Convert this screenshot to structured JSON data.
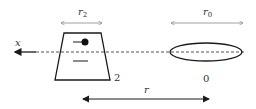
{
  "diagram": {
    "axis_label": "x",
    "body2": {
      "width_label_main": "r",
      "width_label_sub": "2",
      "id_label": "2"
    },
    "body0": {
      "width_label_main": "r",
      "width_label_sub": "0",
      "id_label": "0"
    },
    "separation_label": "r",
    "colors": {
      "stroke": "#1a1a1a",
      "dim": "#777777",
      "dash": "#555555"
    }
  }
}
